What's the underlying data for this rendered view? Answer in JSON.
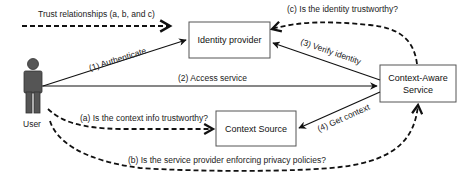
{
  "legend": {
    "label": "Trust relationships (a, b, and c)"
  },
  "actors": {
    "user": {
      "label": "User"
    }
  },
  "nodes": {
    "identity_provider": {
      "label": "Identity provider"
    },
    "context_aware_service": {
      "line1": "Context-Aware",
      "line2": "Service"
    },
    "context_source": {
      "label": "Context Source"
    }
  },
  "edges": {
    "authenticate": {
      "label": "(1) Authenticate",
      "style": "solid"
    },
    "access_service": {
      "label": "(2) Access service",
      "style": "solid"
    },
    "verify_identity": {
      "label": "(3) Verify identity",
      "style": "solid"
    },
    "get_context": {
      "label": "(4) Get context",
      "style": "solid"
    },
    "trust_a": {
      "label": "(a) Is the context info trustworthy?",
      "style": "dashed"
    },
    "trust_b": {
      "label": "(b) Is the service provider enforcing privacy policies?",
      "style": "dashed"
    },
    "trust_c": {
      "label": "(c) Is the identity trustworthy?",
      "style": "dashed"
    }
  },
  "colors": {
    "stroke": "#111111",
    "box_border": "#555555",
    "user_fill": "#555555",
    "text": "#222222"
  }
}
